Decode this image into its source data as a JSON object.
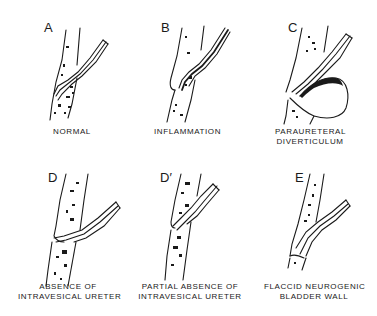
{
  "diagram": {
    "type": "medical-illustration",
    "panels": [
      {
        "letter": "A",
        "caption": [
          "NORMAL"
        ]
      },
      {
        "letter": "B",
        "caption": [
          "INFLAMMATION"
        ]
      },
      {
        "letter": "C",
        "caption": [
          "PARAURETERAL",
          "DIVERTICULUM"
        ]
      },
      {
        "letter": "D",
        "caption": [
          "ABSENCE OF",
          "INTRAVESICAL URETER"
        ]
      },
      {
        "letter": "D′",
        "caption": [
          "PARTIAL ABSENCE OF",
          "INTRAVESICAL URETER"
        ]
      },
      {
        "letter": "E",
        "caption": [
          "FLACCID NEUROGENIC",
          "BLADDER WALL"
        ]
      }
    ]
  },
  "colors": {
    "ink": "#1a1a1a",
    "background": "#ffffff"
  }
}
